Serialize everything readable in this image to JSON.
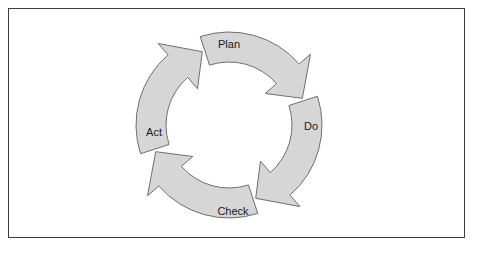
{
  "diagram": {
    "type": "cyclic-process-diagram",
    "direction": "clockwise",
    "background_color": "#ffffff",
    "frame": {
      "border_color": "#3d3d3d",
      "fill_color": "#ffffff"
    },
    "style": {
      "segment_fill": "#d6d6d6",
      "segment_stroke": "#6f6f6f",
      "label_color": "#1a1a1a",
      "inner_fill": "#ffffff"
    },
    "geometry": {
      "center_x": 220,
      "center_y": 116,
      "outer_radius": 93,
      "inner_radius": 63,
      "barb_extend": 15,
      "gap_degrees": 4
    },
    "segments": [
      {
        "id": "plan",
        "label": "Plan",
        "start_angle": -112,
        "end_angle": -22,
        "label_x": 220,
        "label_y": 36,
        "arrow_at": "end"
      },
      {
        "id": "do",
        "label": "Do",
        "start_angle": -22,
        "end_angle": 68,
        "label_x": 302,
        "label_y": 118,
        "arrow_at": "end"
      },
      {
        "id": "check",
        "label": "Check",
        "start_angle": 68,
        "end_angle": 158,
        "label_x": 224,
        "label_y": 203,
        "arrow_at": "end"
      },
      {
        "id": "act",
        "label": "Act",
        "start_angle": 158,
        "end_angle": 248,
        "label_x": 145,
        "label_y": 124,
        "arrow_at": "end"
      }
    ]
  }
}
